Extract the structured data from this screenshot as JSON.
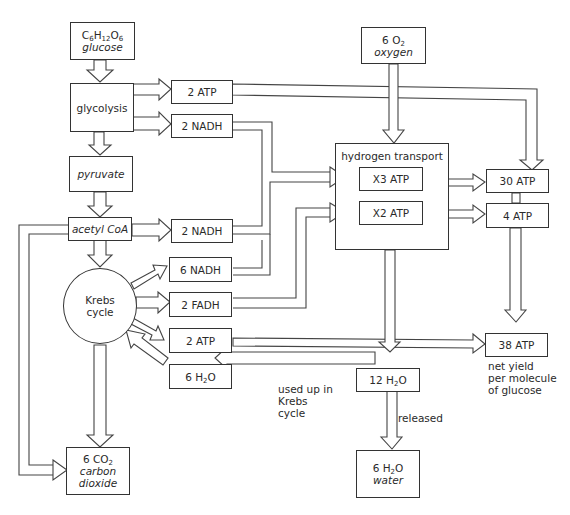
{
  "nodes": {
    "glucose": {
      "formula_pre": "C",
      "s1": "6",
      "mid1": "H",
      "s2": "12",
      "mid2": "O",
      "s3": "6",
      "name": "glucose"
    },
    "glycolysis": {
      "label": "glycolysis"
    },
    "pyruvate": {
      "label": "pyruvate"
    },
    "acetyl_coa": {
      "label": "acetyl CoA"
    },
    "krebs": {
      "line1": "Krebs",
      "line2": "cycle"
    },
    "co2": {
      "formula_pre": "6 CO",
      "s1": "2",
      "name_line1": "carbon",
      "name_line2": "dioxide"
    },
    "atp_glycolysis": {
      "label": "2 ATP"
    },
    "nadh_glycolysis": {
      "label": "2 NADH"
    },
    "nadh_acetyl": {
      "label": "2 NADH"
    },
    "nadh_krebs": {
      "label": "6 NADH"
    },
    "fadh_krebs": {
      "label": "2 FADH"
    },
    "atp_krebs": {
      "label": "2 ATP"
    },
    "water_used": {
      "formula_pre": "6 H",
      "s1": "2",
      "post": "O"
    },
    "oxygen": {
      "formula_pre": "6 O",
      "s1": "2",
      "name": "oxygen"
    },
    "hydrogen_transport": {
      "label": "hydrogen transport"
    },
    "x3_atp": {
      "label": "X3 ATP"
    },
    "x2_atp": {
      "label": "X2 ATP"
    },
    "atp_30": {
      "label": "30 ATP"
    },
    "atp_4": {
      "label": "4 ATP"
    },
    "atp_38": {
      "label": "38 ATP"
    },
    "water_12": {
      "formula_pre": "12 H",
      "s1": "2",
      "post": "O"
    },
    "water_6": {
      "formula_pre": "6 H",
      "s1": "2",
      "post": "O",
      "name": "water"
    }
  },
  "annotations": {
    "used_up": [
      "used up in",
      "Krebs",
      "cycle"
    ],
    "released": "released",
    "net_yield": [
      "net yield",
      "per molecule",
      "of glucose"
    ]
  }
}
